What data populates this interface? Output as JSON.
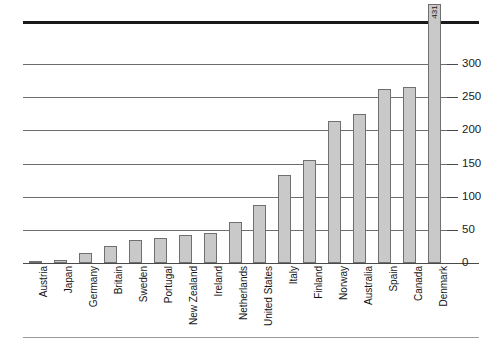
{
  "chart_data": {
    "type": "bar",
    "title": "",
    "subtitle": "",
    "xlabel": "",
    "ylabel": "",
    "ylim": [
      0,
      300
    ],
    "grid": true,
    "legend": null,
    "axis_note": "broken axis - Denmark bar exceeds plotted scale, value labelled directly",
    "tick_labels": [
      "0",
      "50",
      "100",
      "150",
      "200",
      "250",
      "300"
    ],
    "ticks": [
      0,
      50,
      100,
      150,
      200,
      250,
      300
    ],
    "categories": [
      "Austria",
      "Japan",
      "Germany",
      "Britain",
      "Sweden",
      "Portugal",
      "New Zealand",
      "Ireland",
      "Netherlands",
      "United States",
      "Italy",
      "Finland",
      "Norway",
      "Australia",
      "Spain",
      "Canada",
      "Denmark"
    ],
    "values": [
      2,
      4,
      15,
      25,
      35,
      38,
      42,
      46,
      62,
      88,
      133,
      155,
      214,
      225,
      262,
      265,
      431
    ],
    "data_labels": {
      "Denmark": "431"
    },
    "colors": {
      "bar_fill": "#c9c9c9",
      "bar_stroke": "#6f6f6f",
      "gridline": "#6d6d6d",
      "axis": "#4a4a4a",
      "top_rule": "#1a1a1a",
      "text": "#1a1a1a"
    }
  }
}
